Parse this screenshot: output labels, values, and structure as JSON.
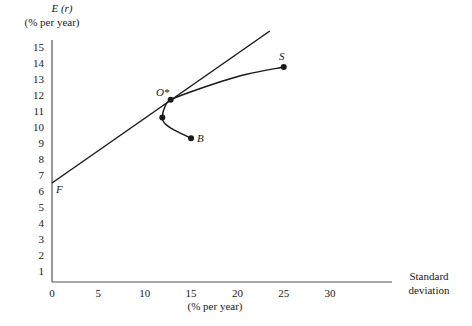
{
  "chart_data": {
    "type": "line",
    "title": "",
    "ylabel": "E (r)",
    "ylabel_unit": "(% per year)",
    "xlabel_line1": "Standard",
    "xlabel_line2": "deviation",
    "xlabel_unit": "(% per year)",
    "x_ticks": [
      0,
      5,
      10,
      15,
      20,
      25,
      30
    ],
    "y_ticks": [
      1,
      2,
      3,
      4,
      5,
      6,
      7,
      8,
      9,
      10,
      11,
      12,
      13,
      14,
      15
    ],
    "xlim": [
      0,
      45
    ],
    "ylim": [
      0,
      16
    ],
    "grid": false,
    "series": [
      {
        "name": "Capital allocation line (F through O*)",
        "type": "line",
        "points": [
          [
            0,
            6.5
          ],
          [
            23.5,
            16.0
          ]
        ]
      },
      {
        "name": "Investment opportunity set (B to S)",
        "type": "curve",
        "points": [
          [
            15.0,
            9.3
          ],
          [
            13.2,
            9.8
          ],
          [
            12.2,
            10.2
          ],
          [
            11.9,
            10.6
          ],
          [
            12.2,
            11.3
          ],
          [
            12.8,
            11.7
          ],
          [
            15,
            12.2
          ],
          [
            18,
            12.8
          ],
          [
            21,
            13.3
          ],
          [
            25.0,
            13.75
          ]
        ]
      }
    ],
    "points": [
      {
        "label": "F",
        "x": 0,
        "y": 6.5,
        "marker": false
      },
      {
        "label": "O*",
        "x": 12.8,
        "y": 11.7,
        "marker": true
      },
      {
        "label": "",
        "x": 11.9,
        "y": 10.6,
        "marker": true
      },
      {
        "label": "B",
        "x": 15.0,
        "y": 9.3,
        "marker": true
      },
      {
        "label": "S",
        "x": 25.0,
        "y": 13.75,
        "marker": true
      }
    ]
  },
  "colors": {
    "ink": "#1a1a1a",
    "axis": "#555555",
    "background": "#ffffff"
  }
}
